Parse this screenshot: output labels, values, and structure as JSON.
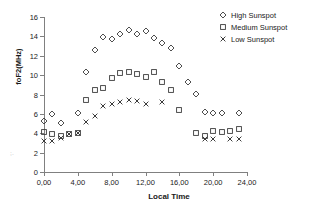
{
  "chart_data": {
    "type": "scatter",
    "title": "",
    "xlabel": "Local Time",
    "ylabel": "foF2(MHz)",
    "xlim": [
      0,
      24
    ],
    "ylim": [
      0,
      16
    ],
    "grid": false,
    "legend_position": "top-right",
    "x_tick_labels": [
      "0,00",
      "4,00",
      "8,00",
      "12,00",
      "16,00",
      "20,00",
      "24,00"
    ],
    "x_ticks": [
      0,
      4,
      8,
      12,
      16,
      20,
      24
    ],
    "y_tick_labels": [
      "0",
      "2",
      "4",
      "6",
      "8",
      "10",
      "12",
      "14",
      "16"
    ],
    "y_ticks": [
      0,
      2,
      4,
      6,
      8,
      10,
      12,
      14,
      16
    ],
    "x": [
      0,
      1,
      2,
      3,
      4,
      5,
      6,
      7,
      8,
      9,
      10,
      11,
      12,
      13,
      14,
      15,
      16,
      17,
      18,
      19,
      20,
      21,
      22,
      23
    ],
    "series": [
      {
        "name": "High Sunspot",
        "marker": "diamond",
        "color": "#3a3a3a",
        "values": [
          5.3,
          6.0,
          5.1,
          null,
          6.1,
          10.35,
          12.55,
          13.95,
          13.75,
          14.25,
          14.7,
          14.25,
          14.6,
          13.85,
          13.3,
          12.85,
          10.9,
          9.25,
          8.1,
          6.15,
          6.05,
          6.05,
          null,
          6.1
        ]
      },
      {
        "name": "Medium Sunspot",
        "marker": "square",
        "color": "#3a3a3a",
        "values": [
          4.15,
          3.9,
          3.7,
          3.95,
          4.0,
          7.4,
          8.5,
          8.65,
          9.7,
          10.25,
          10.35,
          10.15,
          9.85,
          10.35,
          9.25,
          8.45,
          6.35,
          null,
          4.05,
          3.75,
          4.2,
          4.1,
          4.25,
          4.4
        ]
      },
      {
        "name": "Low Sunspot",
        "marker": "cross",
        "color": "#3a3a3a",
        "values": [
          3.25,
          3.25,
          3.5,
          3.95,
          4.0,
          5.15,
          5.8,
          6.8,
          7.0,
          7.25,
          7.45,
          7.3,
          7.05,
          null,
          7.25,
          null,
          null,
          null,
          null,
          3.45,
          3.4,
          null,
          3.45,
          3.4
        ]
      }
    ]
  },
  "legend": {
    "items": [
      {
        "label": "High Sunspot",
        "marker": "diamond"
      },
      {
        "label": "Medium Sunspot",
        "marker": "square"
      },
      {
        "label": "Low Sunspot",
        "marker": "cross"
      }
    ]
  },
  "artifact": {
    "text": "; ."
  }
}
